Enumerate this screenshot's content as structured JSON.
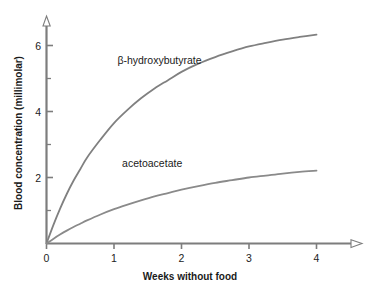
{
  "chart_data": {
    "type": "line",
    "title": "",
    "xlabel": "Weeks without food",
    "ylabel": "Blood concentration (millimolar)",
    "xlim": [
      0,
      4.7
    ],
    "ylim": [
      0,
      7.0
    ],
    "grid": false,
    "legend_position": "inline-annotation",
    "x_ticks_major": [
      0,
      1,
      2,
      3,
      4
    ],
    "x_tick_labels": [
      "0",
      "1",
      "2",
      "3",
      "4"
    ],
    "y_ticks_major": [
      2,
      4,
      6
    ],
    "y_tick_labels": [
      "2",
      "4",
      "6"
    ],
    "y_ticks_minor": [
      1,
      3,
      5
    ],
    "series": [
      {
        "name": "β-hydroxybutyrate",
        "label_x": 1.05,
        "label_y": 5.45,
        "color": "#808080",
        "x": [
          0,
          0.1,
          0.2,
          0.3,
          0.4,
          0.5,
          0.6,
          0.8,
          1.0,
          1.2,
          1.4,
          1.6,
          1.8,
          2.0,
          2.25,
          2.5,
          2.75,
          3.0,
          3.25,
          3.5,
          3.75,
          4.0
        ],
        "y": [
          0,
          0.55,
          1.05,
          1.5,
          1.9,
          2.25,
          2.6,
          3.15,
          3.65,
          4.05,
          4.4,
          4.7,
          4.95,
          5.2,
          5.45,
          5.65,
          5.82,
          5.97,
          6.08,
          6.18,
          6.26,
          6.33
        ]
      },
      {
        "name": "acetoacetate",
        "label_x": 1.12,
        "label_y": 2.32,
        "color": "#8a8a8a",
        "x": [
          0,
          0.1,
          0.2,
          0.3,
          0.4,
          0.5,
          0.6,
          0.8,
          1.0,
          1.2,
          1.4,
          1.6,
          1.8,
          2.0,
          2.25,
          2.5,
          2.75,
          3.0,
          3.25,
          3.5,
          3.75,
          4.0
        ],
        "y": [
          0,
          0.14,
          0.27,
          0.39,
          0.5,
          0.6,
          0.7,
          0.88,
          1.04,
          1.18,
          1.31,
          1.43,
          1.53,
          1.63,
          1.74,
          1.84,
          1.92,
          2.0,
          2.06,
          2.12,
          2.17,
          2.21
        ]
      }
    ]
  },
  "axes": {
    "x_axis_label": "Weeks without food",
    "y_axis_label": "Blood concentration (millimolar)",
    "axis_color": "#7d7d7d"
  },
  "ticks": {
    "x": [
      "0",
      "1",
      "2",
      "3",
      "4"
    ],
    "y": [
      "2",
      "4",
      "6"
    ]
  },
  "labels": {
    "series_1": "β-hydroxybutyrate",
    "series_2": "acetoacetate"
  }
}
